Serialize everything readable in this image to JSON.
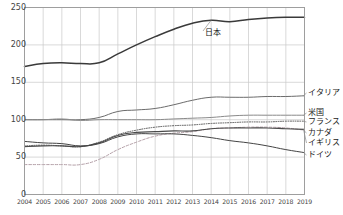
{
  "chart_data": {
    "type": "line",
    "title": "",
    "subtitle": "",
    "xlabel": "",
    "ylabel": "",
    "x": [
      2004,
      2005,
      2006,
      2007,
      2008,
      2009,
      2010,
      2011,
      2012,
      2013,
      2014,
      2015,
      2016,
      2017,
      2018,
      2019
    ],
    "xtick_labels": [
      "2004",
      "2005",
      "2006",
      "2007",
      "2008",
      "2009",
      "2010",
      "2011",
      "2012",
      "2013",
      "2014",
      "2015",
      "2016",
      "2017",
      "2018",
      "2019"
    ],
    "ytick_labels": [
      "0",
      "50",
      "100",
      "150",
      "200",
      "250"
    ],
    "yticks": [
      0,
      50,
      100,
      150,
      200,
      250
    ],
    "ylim": [
      0,
      250
    ],
    "grid": true,
    "legend_position": "right-of-plot-and-inline",
    "series": [
      {
        "name": "日本",
        "label": "日本",
        "label_placement": "inline-with-leader",
        "color": "#3a3a3a",
        "style": "solid",
        "width": 1.5,
        "values": [
          171,
          175,
          176,
          175,
          176,
          188,
          200,
          211,
          221,
          229,
          233,
          231,
          234,
          236,
          237,
          237
        ]
      },
      {
        "name": "イタリア",
        "label": "イタリア",
        "label_placement": "right",
        "color": "#6b6b6b",
        "style": "solid",
        "width": 1.0,
        "values": [
          100,
          100,
          100,
          100,
          103,
          111,
          113,
          115,
          120,
          126,
          130,
          130,
          130,
          131,
          131,
          132
        ]
      },
      {
        "name": "米国",
        "label": "米国",
        "label_placement": "right",
        "color": "#8a8a8a",
        "style": "solid",
        "width": 1.0,
        "values": [
          100,
          100,
          101,
          99,
          100,
          100,
          100,
          100,
          101,
          102,
          103,
          105,
          106,
          106,
          106,
          106
        ]
      },
      {
        "name": "フランス",
        "label": "フランス",
        "label_placement": "right",
        "color": "#555555",
        "style": "dotted",
        "width": 1.0,
        "values": [
          65,
          66,
          65,
          64,
          70,
          80,
          86,
          90,
          92,
          93,
          95,
          96,
          97,
          97,
          98,
          98
        ]
      },
      {
        "name": "カナダ",
        "label": "カナダ",
        "label_placement": "right",
        "color": "#b4a0a8",
        "style": "dashed",
        "width": 1.0,
        "values": [
          40,
          40,
          40,
          40,
          47,
          60,
          70,
          78,
          82,
          84,
          88,
          89,
          90,
          90,
          89,
          86
        ]
      },
      {
        "name": "イギリス",
        "label": "イギリス",
        "label_placement": "right",
        "color": "#4a4a4a",
        "style": "solid",
        "width": 1.1,
        "values": [
          64,
          65,
          65,
          64,
          69,
          79,
          83,
          84,
          85,
          85,
          88,
          89,
          89,
          89,
          88,
          87
        ]
      },
      {
        "name": "ドイツ",
        "label": "ドイツ",
        "label_placement": "right",
        "color": "#444444",
        "style": "solid",
        "width": 1.0,
        "values": [
          71,
          69,
          68,
          65,
          68,
          77,
          81,
          81,
          81,
          79,
          76,
          72,
          69,
          65,
          60,
          56
        ]
      }
    ]
  }
}
